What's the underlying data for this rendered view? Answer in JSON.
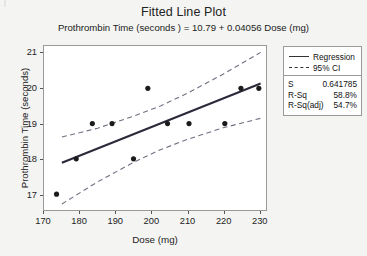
{
  "chart": {
    "title": "Fitted Line Plot",
    "subtitle": "Prothrombin Time (seconds ) = 10.79 + 0.04056 Dose (mg)",
    "xlabel": "Dose (mg)",
    "ylabel": "Prothrombin Time (seconds)"
  },
  "legend": {
    "items": [
      {
        "label": "Regression",
        "style": "solid"
      },
      {
        "label": "95% CI",
        "style": "dashed"
      }
    ]
  },
  "stats": {
    "rows": [
      {
        "key": "S",
        "value": "0.641785"
      },
      {
        "key": "R-Sq",
        "value": "58.8%"
      },
      {
        "key": "R-Sq(adj)",
        "value": "54.7%"
      }
    ]
  },
  "chart_data": {
    "type": "scatter",
    "title": "Fitted Line Plot",
    "subtitle": "Prothrombin Time (seconds ) = 10.79 + 0.04056 Dose (mg)",
    "xlabel": "Dose (mg)",
    "ylabel": "Prothrombin Time (seconds)",
    "xlim": [
      170,
      232
    ],
    "ylim": [
      16.55,
      21.2
    ],
    "xticks": [
      170,
      180,
      190,
      200,
      210,
      220,
      230
    ],
    "yticks": [
      17,
      18,
      19,
      20,
      21
    ],
    "grid": false,
    "legend_position": "outside-right-top",
    "points": [
      {
        "x": 173.5,
        "y": 17.0
      },
      {
        "x": 179.0,
        "y": 18.0
      },
      {
        "x": 183.5,
        "y": 19.0
      },
      {
        "x": 189.0,
        "y": 19.0
      },
      {
        "x": 195.0,
        "y": 18.0
      },
      {
        "x": 199.0,
        "y": 20.0
      },
      {
        "x": 204.5,
        "y": 19.0
      },
      {
        "x": 210.5,
        "y": 19.0
      },
      {
        "x": 220.5,
        "y": 19.0
      },
      {
        "x": 225.0,
        "y": 20.0
      },
      {
        "x": 230.0,
        "y": 20.0
      }
    ],
    "fit": {
      "intercept": 10.79,
      "slope": 0.04056,
      "x_start": 175.0,
      "x_end": 230.5,
      "equation": "Prothrombin Time (seconds ) = 10.79 + 0.04056 Dose (mg)"
    },
    "ci_band": {
      "label": "95% CI",
      "level": 0.95,
      "x_start": 175.0,
      "x_end": 230.5,
      "upper": [
        {
          "x": 175.0,
          "y": 18.62
        },
        {
          "x": 185.0,
          "y": 18.87
        },
        {
          "x": 195.0,
          "y": 19.21
        },
        {
          "x": 202.5,
          "y": 19.5
        },
        {
          "x": 210.0,
          "y": 19.86
        },
        {
          "x": 220.0,
          "y": 20.4
        },
        {
          "x": 230.5,
          "y": 21.02
        }
      ],
      "lower": [
        {
          "x": 175.0,
          "y": 16.72
        },
        {
          "x": 185.0,
          "y": 17.35
        },
        {
          "x": 195.0,
          "y": 17.9
        },
        {
          "x": 202.5,
          "y": 18.26
        },
        {
          "x": 210.0,
          "y": 18.55
        },
        {
          "x": 220.0,
          "y": 18.88
        },
        {
          "x": 230.5,
          "y": 19.15
        }
      ]
    },
    "stats_box": {
      "S": "0.641785",
      "R-Sq": "58.8%",
      "R-Sq(adj)": "54.7%"
    },
    "colors": {
      "marker": "#1b1b1b",
      "regression_line": "#2a2a3a",
      "ci_line": "#6f6f80",
      "frame": "#9a9a9a",
      "background": "#f4f4f2",
      "plot_background": "#ffffff"
    }
  }
}
